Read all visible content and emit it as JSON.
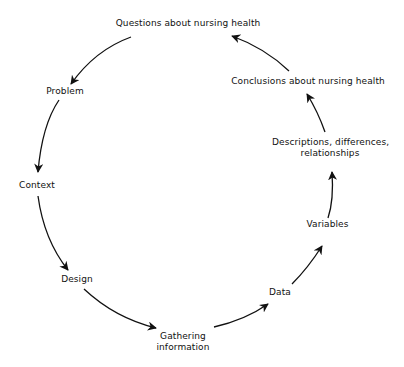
{
  "diagram": {
    "type": "cycle",
    "colors": {
      "text": "#111111",
      "arrow": "#111111",
      "background": "#ffffff"
    },
    "nodes": [
      {
        "id": "questions",
        "label": "Questions about nursing health"
      },
      {
        "id": "problem",
        "label": "Problem"
      },
      {
        "id": "context",
        "label": "Context"
      },
      {
        "id": "design",
        "label": "Design"
      },
      {
        "id": "gathering",
        "line1": "Gathering",
        "line2": "information"
      },
      {
        "id": "data",
        "label": "Data"
      },
      {
        "id": "variables",
        "label": "Variables"
      },
      {
        "id": "descriptions",
        "line1": "Descriptions, differences,",
        "line2": "relationships"
      },
      {
        "id": "conclusions",
        "label": "Conclusions about nursing health"
      }
    ],
    "edges": [
      {
        "from": "questions",
        "to": "problem"
      },
      {
        "from": "problem",
        "to": "context"
      },
      {
        "from": "context",
        "to": "design"
      },
      {
        "from": "design",
        "to": "gathering"
      },
      {
        "from": "gathering",
        "to": "data"
      },
      {
        "from": "data",
        "to": "variables"
      },
      {
        "from": "variables",
        "to": "descriptions"
      },
      {
        "from": "descriptions",
        "to": "conclusions"
      },
      {
        "from": "conclusions",
        "to": "questions"
      }
    ]
  }
}
